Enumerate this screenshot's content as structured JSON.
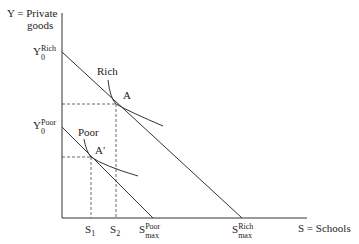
{
  "diagram": {
    "y_axis_label_line1": "Y = Private",
    "y_axis_label_line2": "goods",
    "x_axis_label": "S = Schools",
    "y0_rich": {
      "base": "Y",
      "sup": "Rich",
      "sub": "0"
    },
    "y0_poor": {
      "base": "Y",
      "sup": "Poor",
      "sub": "0"
    },
    "curve_label_rich": "Rich",
    "curve_label_poor": "Poor",
    "point_rich": "A",
    "point_poor": "A′",
    "s1": {
      "base": "S",
      "sub": "1"
    },
    "s2": {
      "base": "S",
      "sub": "2"
    },
    "smax_poor": {
      "base": "S",
      "sup": "Poor",
      "sub": "max"
    },
    "smax_rich": {
      "base": "S",
      "sup": "Rich",
      "sub": "max"
    },
    "line_color": "#333333"
  }
}
